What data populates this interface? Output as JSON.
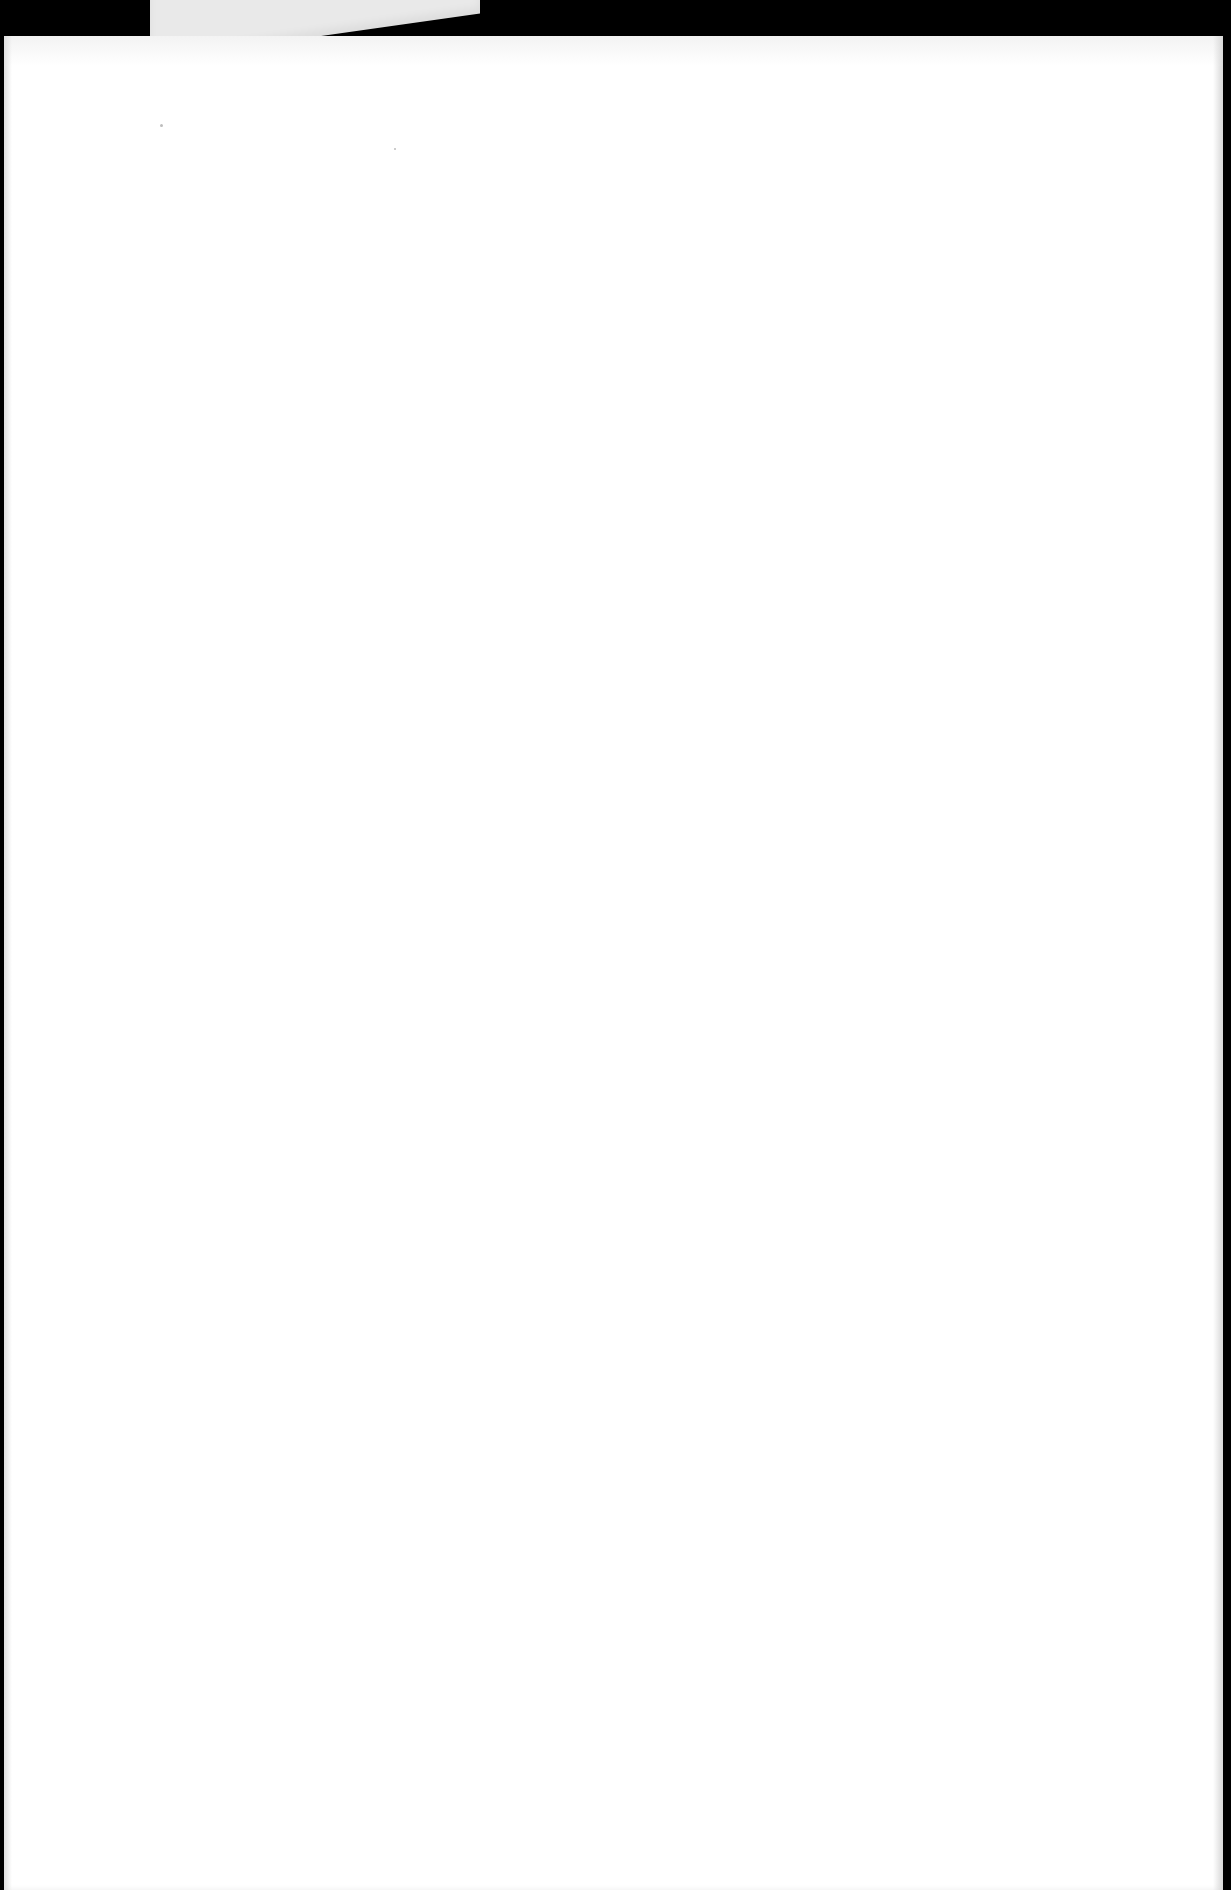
{
  "document": {
    "type": "scanned-page",
    "content": "blank",
    "background_color": "#000000",
    "paper_color": "#ffffff",
    "back_card_color": "#e9e9e9"
  }
}
